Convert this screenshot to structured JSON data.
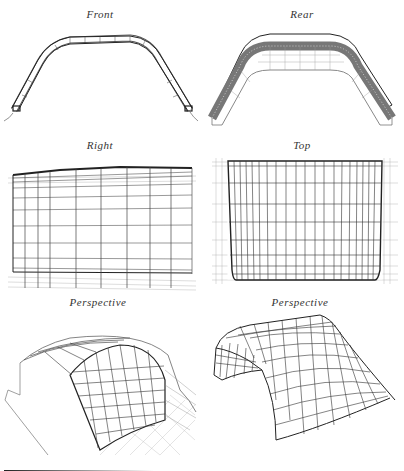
{
  "figure": {
    "panels": [
      {
        "id": "front",
        "label": "Front"
      },
      {
        "id": "rear",
        "label": "Rear"
      },
      {
        "id": "right",
        "label": "Right"
      },
      {
        "id": "top",
        "label": "Top"
      },
      {
        "id": "perspective-1",
        "label": "Perspective"
      },
      {
        "id": "perspective-2",
        "label": "Perspective"
      }
    ]
  },
  "colors": {
    "line": "#222222",
    "light_line": "#888888",
    "background": "#ffffff"
  }
}
